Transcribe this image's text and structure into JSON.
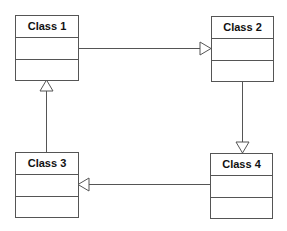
{
  "diagram": {
    "type": "uml-class-diagram",
    "classes": [
      {
        "id": "c1",
        "name": "Class 1",
        "attributes": [],
        "methods": []
      },
      {
        "id": "c2",
        "name": "Class 2",
        "attributes": [],
        "methods": []
      },
      {
        "id": "c3",
        "name": "Class 3",
        "attributes": [],
        "methods": []
      },
      {
        "id": "c4",
        "name": "Class 4",
        "attributes": [],
        "methods": []
      }
    ],
    "relationships": [
      {
        "from": "c1",
        "to": "c2",
        "kind": "generalization",
        "arrowhead": "hollow-triangle"
      },
      {
        "from": "c2",
        "to": "c4",
        "kind": "generalization",
        "arrowhead": "hollow-triangle"
      },
      {
        "from": "c4",
        "to": "c3",
        "kind": "generalization",
        "arrowhead": "hollow-triangle"
      },
      {
        "from": "c3",
        "to": "c1",
        "kind": "generalization",
        "arrowhead": "hollow-triangle"
      }
    ],
    "colors": {
      "stroke": "#555555",
      "text": "#111111",
      "background": "#ffffff"
    }
  }
}
